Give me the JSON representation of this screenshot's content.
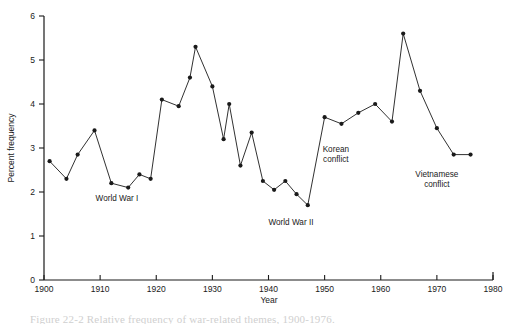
{
  "figure": {
    "caption": "Figure 22-2  Relative frequency of war-related themes, 1900-1976.",
    "background_color": "#ffffff",
    "line_color": "#1a1a1a",
    "marker_color": "#1a1a1a"
  },
  "chart_data": {
    "type": "line",
    "title": "",
    "xlabel": "Year",
    "ylabel": "Percent frequency",
    "xlim": [
      1900,
      1980
    ],
    "ylim": [
      0,
      6
    ],
    "xticks": [
      1900,
      1910,
      1920,
      1930,
      1940,
      1950,
      1960,
      1970,
      1980
    ],
    "xtick_labels": [
      "1900",
      "1910",
      "1920",
      "1930",
      "1940",
      "1950",
      "1960",
      "1970",
      "1980"
    ],
    "yticks": [
      0,
      1,
      2,
      3,
      4,
      5,
      6
    ],
    "ytick_labels": [
      "0",
      "1",
      "2",
      "3",
      "4",
      "5",
      "6"
    ],
    "grid": false,
    "legend": false,
    "marker": "filled-circle",
    "x": [
      1901,
      1904,
      1906,
      1909,
      1912,
      1915,
      1917,
      1919,
      1921,
      1924,
      1926,
      1927,
      1930,
      1932,
      1933,
      1935,
      1937,
      1939,
      1941,
      1943,
      1945,
      1947,
      1950,
      1953,
      1956,
      1959,
      1962,
      1964,
      1967,
      1970,
      1973,
      1976
    ],
    "values": [
      2.7,
      2.3,
      2.85,
      3.4,
      2.2,
      2.1,
      2.4,
      2.3,
      4.1,
      3.95,
      4.6,
      5.3,
      4.4,
      3.2,
      4.0,
      2.6,
      3.35,
      2.25,
      2.05,
      2.25,
      1.95,
      1.7,
      3.7,
      3.55,
      3.8,
      4.0,
      3.6,
      5.6,
      4.3,
      3.45,
      2.85,
      2.85
    ],
    "annotations": [
      {
        "text": "World War I",
        "x": 1913,
        "y": 1.8
      },
      {
        "text": "World War II",
        "x": 1944,
        "y": 1.25
      },
      {
        "text": "Korean conflict",
        "lines": [
          "Korean",
          "conflict"
        ],
        "x": 1952,
        "y": 2.9
      },
      {
        "text": "Vietnamese conflict",
        "lines": [
          "Vietnamese",
          "conflict"
        ],
        "x": 1970,
        "y": 2.35
      }
    ]
  }
}
